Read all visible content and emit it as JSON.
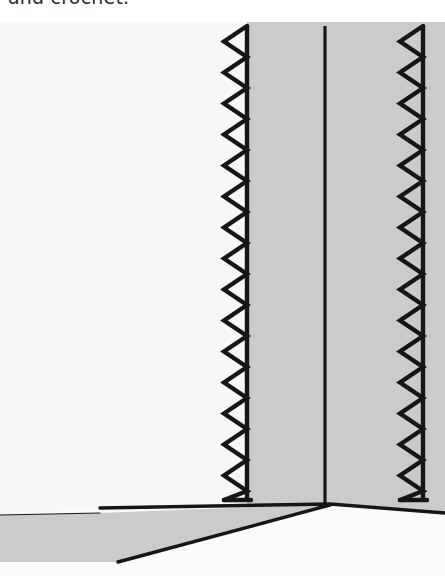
{
  "document": {
    "caption_line": "and crochet.",
    "figure_title": "Zigzag-stitched hem on folded fabric"
  },
  "colors": {
    "page_background": "#ffffff",
    "plate_background": "#fbfbfb",
    "paper_white": "#fafafa",
    "fabric_light": "#f7f7f7",
    "fabric_gray": "#cbcbcb",
    "fabric_gray_2": "#c9c9c9",
    "ink_black": "#161616",
    "caption_ink": "#2a2a2a"
  },
  "figure": {
    "type": "line-illustration",
    "plate": {
      "x": 0,
      "y": 22,
      "width": 445,
      "height": 554
    },
    "regions": [
      {
        "name": "left-fabric-panel",
        "fill": "#f7f7f7",
        "note": "large pale panel occupying the left two thirds of the plate"
      },
      {
        "name": "center-fabric-panel",
        "fill": "#cbcbcb",
        "note": "shaded panel between the left zigzag seam and the center fold line"
      },
      {
        "name": "right-fabric-panel",
        "fill": "#cbcbcb",
        "note": "shaded panel between the center fold line and the right zigzag seam"
      },
      {
        "name": "lower-wedge-panel",
        "fill": "#cbcbcb",
        "note": "tapering gray under-layer running from the lower left to the convergence point"
      }
    ],
    "stitch_lines": [
      {
        "name": "left-zigzag-seam",
        "axis_x": 247,
        "amplitude_x": 23,
        "top_y": 26,
        "bottom_y": 500,
        "period": 31,
        "stroke": "#161616",
        "stroke_width": 4.4,
        "direction": "peaks-point-left"
      },
      {
        "name": "right-zigzag-seam",
        "axis_x": 423,
        "amplitude_x": 23,
        "top_y": 26,
        "bottom_y": 500,
        "period": 31,
        "stroke": "#161616",
        "stroke_width": 4.4,
        "direction": "peaks-point-left"
      }
    ],
    "fold_line": {
      "name": "center-fold-line",
      "x": 325,
      "top_y": 26,
      "bottom_y": 503,
      "stroke": "#161616",
      "stroke_width": 3.2
    },
    "hem_edges": [
      {
        "name": "upper-hem-edge",
        "points": "100,508 330,503 440,512",
        "stroke": "#161616",
        "stroke_width": 3.4
      },
      {
        "name": "lower-wedge-edge",
        "points": "118,562 330,505",
        "stroke": "#161616",
        "stroke_width": 3.4
      },
      {
        "name": "wedge-top-edge",
        "points": "0,515 100,513",
        "stroke": "#161616",
        "stroke_width": 1.0
      }
    ],
    "convergence_point": {
      "x": 330,
      "y": 504
    }
  }
}
